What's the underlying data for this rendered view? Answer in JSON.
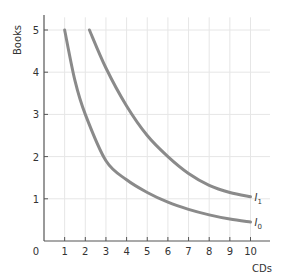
{
  "chart_data": {
    "type": "line",
    "title": "",
    "xlabel": "CDs",
    "ylabel": "Books",
    "xlim": [
      0,
      10.5
    ],
    "ylim": [
      0,
      5.3
    ],
    "x_ticks": [
      "0",
      "1",
      "2",
      "3",
      "4",
      "5",
      "6",
      "7",
      "8",
      "9",
      "10"
    ],
    "y_ticks": [
      "1",
      "2",
      "3",
      "4",
      "5"
    ],
    "grid": true,
    "legend": "inline labels at curve ends",
    "series": [
      {
        "name": "I0",
        "label_main": "I",
        "label_sub": "0",
        "x": [
          1,
          1.5,
          2,
          3,
          4,
          5,
          6,
          7,
          8,
          9,
          10
        ],
        "y": [
          5,
          3.8,
          3.0,
          1.9,
          1.45,
          1.15,
          0.92,
          0.75,
          0.62,
          0.52,
          0.45
        ]
      },
      {
        "name": "I1",
        "label_main": "I",
        "label_sub": "1",
        "x": [
          2.2,
          3,
          4,
          5,
          6,
          7,
          8,
          9,
          10
        ],
        "y": [
          5,
          4.1,
          3.2,
          2.5,
          2.0,
          1.6,
          1.32,
          1.15,
          1.05
        ]
      }
    ],
    "colors": {
      "curve": "#8a8a8a",
      "grid": "#e6e6e6",
      "axis": "#555555"
    }
  }
}
